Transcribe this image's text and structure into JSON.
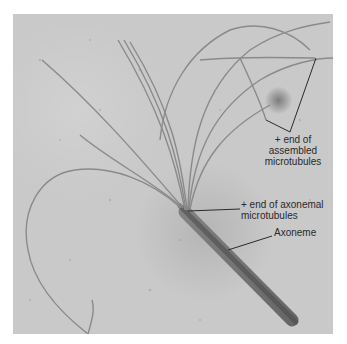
{
  "figure": {
    "labels": {
      "assembled_plus_end": [
        "+ end of",
        "assembled",
        "microtubules"
      ],
      "axonemal_plus_end": [
        "+ end of axonemal",
        "microtubules"
      ],
      "axoneme": "Axoneme"
    },
    "colors": {
      "background": "#c9c9c9",
      "filament": "#8a8a8a",
      "axoneme": "#555555",
      "leader_line": "#2a2a2a",
      "border": "#ffffff"
    }
  }
}
